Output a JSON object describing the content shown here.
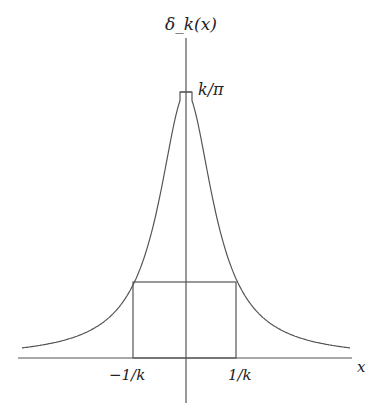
{
  "diagram": {
    "y_axis_label": "δ_k(x)",
    "x_axis_label": "x",
    "peak_label": "k/π",
    "tick_left_label": "−1/k",
    "tick_right_label": "1/k",
    "colors": {
      "line": "#555555",
      "text": "#222222",
      "background": "#ffffff"
    }
  },
  "chart_data": {
    "type": "line",
    "title": "",
    "xlabel": "x",
    "ylabel": "δ_k(x)",
    "function": "δ_k(x) = (k/π) / (1 + k²x²)",
    "peak": {
      "x": 0,
      "y_label": "k/π"
    },
    "rectangle": {
      "x_from": "-1/k",
      "x_to": "1/k",
      "note": "box spanning −1/k to 1/k under the curve"
    },
    "x_ticks": [
      "−1/k",
      "1/k"
    ],
    "grid": false
  }
}
